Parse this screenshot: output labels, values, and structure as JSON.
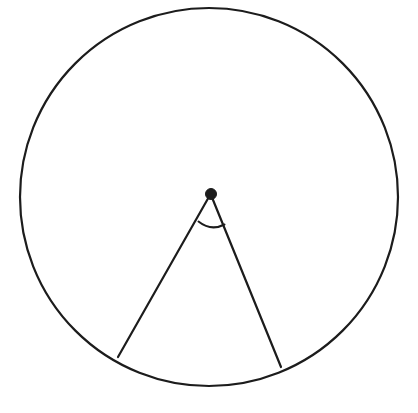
{
  "figure": {
    "background_color": "#ffffff",
    "stroke_color": "#1c1c1c",
    "canvas": {
      "width": 418,
      "height": 413
    }
  },
  "geometry": {
    "circle": {
      "label": "circle-outline",
      "center_x": 209,
      "center_y": 197,
      "radius": 189,
      "stroke_width": 2.2
    },
    "center_point": {
      "label": "center-dot",
      "x": 211,
      "y": 194,
      "radius": 5.5
    },
    "radius_left": {
      "label": "radius-left",
      "x1": 210,
      "y1": 195,
      "x2": 118,
      "y2": 357,
      "stroke_width": 2.2
    },
    "radius_right": {
      "label": "radius-right",
      "x1": 211,
      "y1": 195,
      "x2": 281,
      "y2": 367,
      "stroke_width": 2.2
    },
    "angle_arc": {
      "label": "angle-arc",
      "path": "M 198.5 221.5 Q 211 231.5 224.5 224.5",
      "stroke_width": 2.0
    }
  },
  "labels": {
    "circle": "circle-outline",
    "center": "center-point",
    "left_side": "radius-left",
    "right_side": "radius-right",
    "arc": "central-angle-arc"
  }
}
